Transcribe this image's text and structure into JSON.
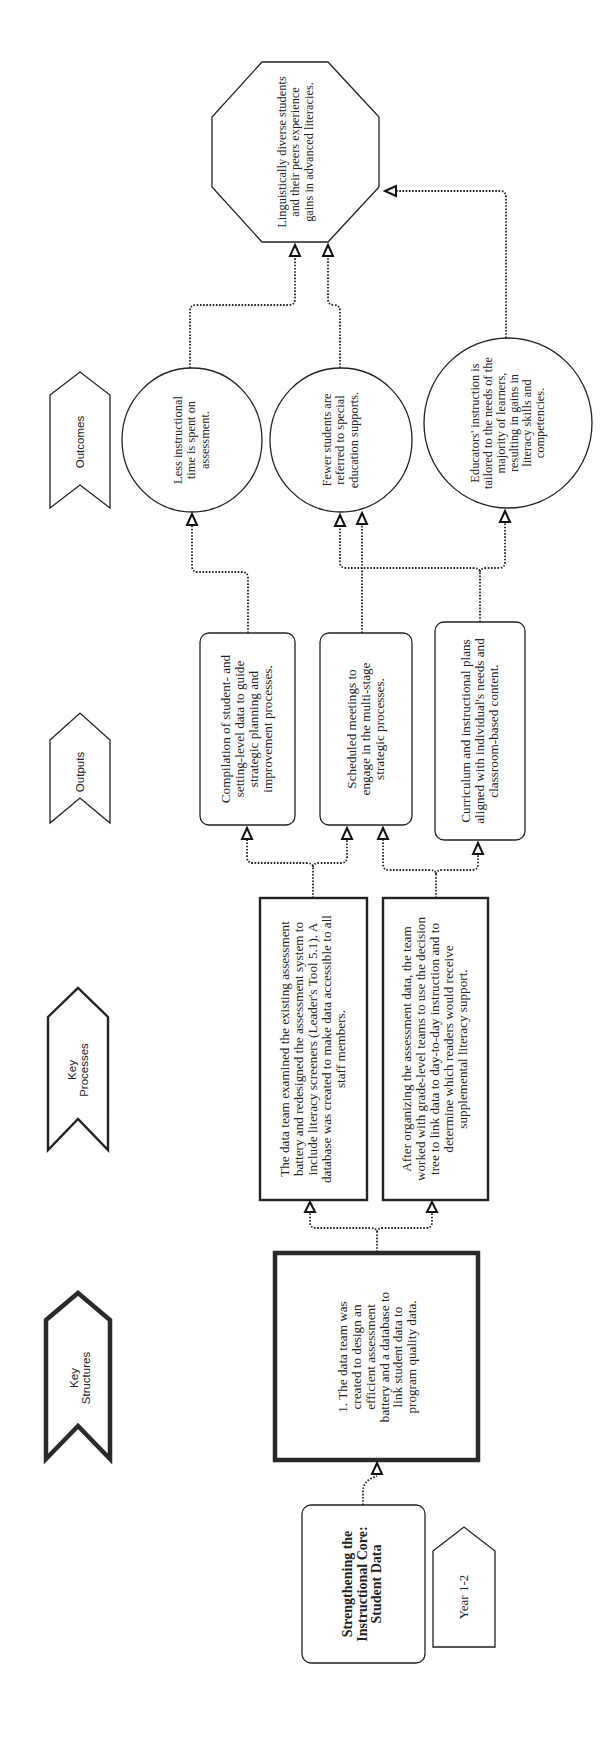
{
  "diagram": {
    "title": "Strengthening the Instructional Core: Student Data",
    "timeframe": "Year 1-2",
    "orientation": "rotated 90 degrees counter-clockwise",
    "column_labels": {
      "key_structures": "Key Structures",
      "key_processes": "Key Processes",
      "outputs": "Outputs",
      "outcomes": "Outcomes"
    },
    "key_structures": [
      {
        "id": "S1",
        "text": "1. The data team was created to design an efficient assessment battery and a database to link student data to program quality data."
      }
    ],
    "key_processes": [
      {
        "id": "P1",
        "text": "The data team examined the existing assessment battery and redesigned the assessment system to include literacy screeners (Leader's Tool 5.1). A database was created to make data accessible to all staff members."
      },
      {
        "id": "P2",
        "text": "After organizing the assessment data, the team worked with grade-level teams to use the decision tree to link data to day-to-day instruction and to determine which readers would receive supplemental literacy support."
      }
    ],
    "outputs": [
      {
        "id": "O1",
        "text": "Compilation of student- and setting-level data to guide strategic planning and improvement processes."
      },
      {
        "id": "O2",
        "text": "Scheduled meetings to engage in the multi-stage strategic processes."
      },
      {
        "id": "O3",
        "text": "Curriculum and instructional plans aligned with individual's needs and classroom-based content."
      }
    ],
    "outcomes": [
      {
        "id": "C1",
        "text": "Less instructional time is spent on assessment."
      },
      {
        "id": "C2",
        "text": "Fewer students are referred to special education supports."
      },
      {
        "id": "C3",
        "text": "Educators' instruction is tailored to the needs of the majority of learners, resulting in gains in literacy skills and competencies."
      }
    ],
    "long_term_outcome": {
      "id": "L1",
      "text": "Linguistically diverse students and their peers experience gains in advanced literacies."
    },
    "connections": [
      [
        "title",
        "S1"
      ],
      [
        "S1",
        "P1"
      ],
      [
        "S1",
        "P2"
      ],
      [
        "P1",
        "O1"
      ],
      [
        "P1",
        "O2"
      ],
      [
        "P2",
        "O2"
      ],
      [
        "P2",
        "O3"
      ],
      [
        "O1",
        "C1"
      ],
      [
        "O2",
        "C2"
      ],
      [
        "O3",
        "C2"
      ],
      [
        "O3",
        "C3"
      ],
      [
        "C1",
        "L1"
      ],
      [
        "C2",
        "L1"
      ],
      [
        "C3",
        "L1"
      ]
    ]
  }
}
